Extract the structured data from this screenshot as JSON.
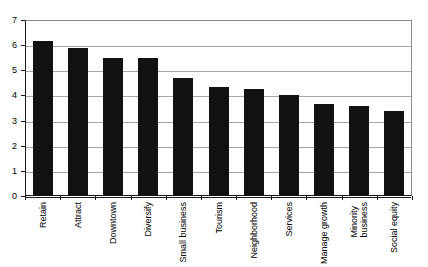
{
  "chart_data": {
    "type": "bar",
    "title": "",
    "subtitle": "",
    "xlabel": "",
    "ylabel": "",
    "ylim": [
      0,
      7
    ],
    "ytick_interval": 1,
    "yticks": [
      "7",
      "6",
      "5",
      "4",
      "3",
      "2",
      "1",
      "0"
    ],
    "grid": true,
    "legend": false,
    "legend_position": "none",
    "bar_color": "#111111",
    "grid_color": "#a8a8a8",
    "axis_color": "#1a1a1a",
    "categories": [
      "Retain",
      "Attract",
      "Downtown",
      "Diversify",
      "Small business",
      "Tourism",
      "Neighborhood",
      "Services",
      "Manage growth",
      "Minority business",
      "Social equity"
    ],
    "category_lines": [
      [
        "Retain"
      ],
      [
        "Attract"
      ],
      [
        "Downtown"
      ],
      [
        "Diversify"
      ],
      [
        "Small business"
      ],
      [
        "Tourism"
      ],
      [
        "Neighborhood"
      ],
      [
        "Services"
      ],
      [
        "Manage growth"
      ],
      [
        "Minority",
        "business"
      ],
      [
        "Social equity"
      ]
    ],
    "values": [
      6.15,
      5.9,
      5.5,
      5.5,
      4.7,
      4.35,
      4.25,
      4.0,
      3.65,
      3.6,
      3.4
    ]
  }
}
